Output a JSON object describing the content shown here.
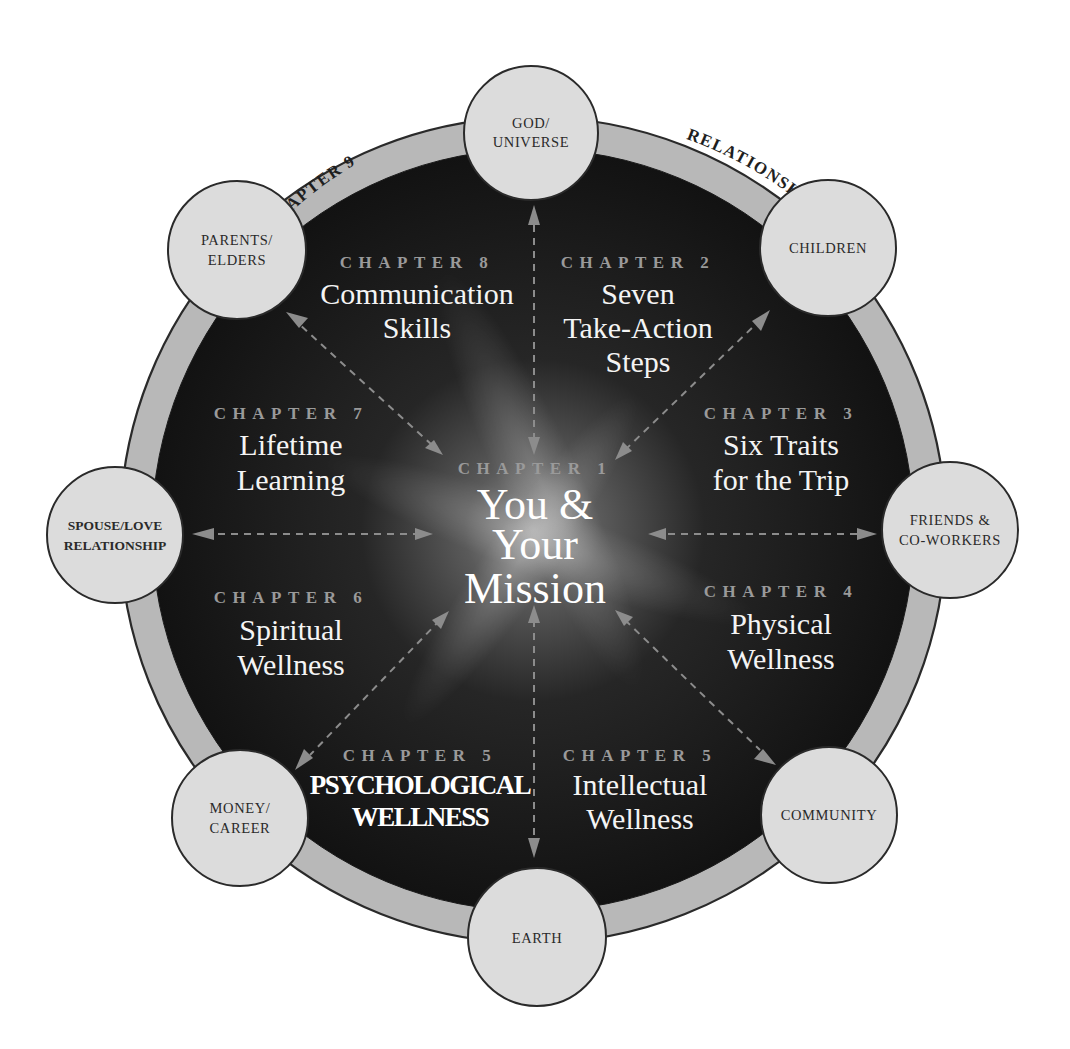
{
  "diagram": {
    "colors": {
      "background": "#ffffff",
      "outer_ring": "#b8b8b8",
      "inner_disk": "#141414",
      "center_glow": "#8a8a8a",
      "satellite_fill": "#dcdcdc",
      "outline": "#2a2a2a",
      "kicker_text": "#9a9a9a",
      "title_text": "#f4f4f4",
      "arrow": "#8c8c8c"
    },
    "ring": {
      "left_label": "CHAPTER 9",
      "right_label": "RELATIONSHIPS"
    },
    "center": {
      "kicker": "CHAPTER 1",
      "line1": "You &",
      "line2": "Your",
      "line3": "Mission"
    },
    "satellites": [
      {
        "id": "god-universe",
        "line1": "GOD/",
        "line2": "UNIVERSE"
      },
      {
        "id": "children",
        "line1": "CHILDREN",
        "line2": ""
      },
      {
        "id": "friends-coworkers",
        "line1": "FRIENDS &",
        "line2": "CO-WORKERS"
      },
      {
        "id": "community",
        "line1": "COMMUNITY",
        "line2": ""
      },
      {
        "id": "earth",
        "line1": "EARTH",
        "line2": ""
      },
      {
        "id": "money-career",
        "line1": "MONEY/",
        "line2": "CAREER"
      },
      {
        "id": "spouse-love",
        "line1": "SPOUSE/LOVE",
        "line2": "RELATIONSHIP"
      },
      {
        "id": "parents-elders",
        "line1": "PARENTS/",
        "line2": "ELDERS"
      }
    ],
    "chapters": [
      {
        "kicker": "CHAPTER 2",
        "lines": [
          "Seven",
          "Take-Action",
          "Steps"
        ]
      },
      {
        "kicker": "CHAPTER 3",
        "lines": [
          "Six Traits",
          "for the Trip"
        ]
      },
      {
        "kicker": "CHAPTER 4",
        "lines": [
          "Physical",
          "Wellness"
        ]
      },
      {
        "kicker": "CHAPTER 5",
        "lines": [
          "Intellectual",
          "Wellness"
        ]
      },
      {
        "kicker": "CHAPTER 5",
        "lines": [
          "PSYCHOLOGICAL",
          "WELLNESS"
        ]
      },
      {
        "kicker": "CHAPTER 6",
        "lines": [
          "Spiritual",
          "Wellness"
        ]
      },
      {
        "kicker": "CHAPTER 7",
        "lines": [
          "Lifetime",
          "Learning"
        ]
      },
      {
        "kicker": "CHAPTER 8",
        "lines": [
          "Communication",
          "Skills"
        ]
      }
    ]
  }
}
